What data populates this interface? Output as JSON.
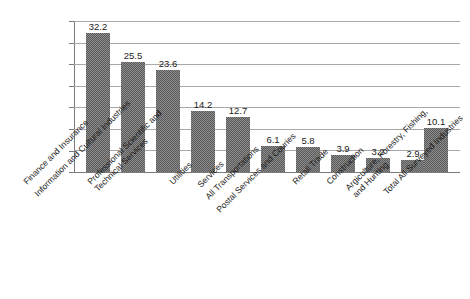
{
  "chart_data": {
    "type": "bar",
    "title": "",
    "subtitle": "",
    "xlabel": "",
    "ylabel": "",
    "ylim": [
      0,
      35
    ],
    "ytick_step": 5,
    "yticks": [
      "0",
      "5",
      "10",
      "15",
      "20",
      "25",
      "30",
      "35"
    ],
    "grid": true,
    "legend": "none",
    "orientation": "vertical",
    "label_rotation_deg": -45,
    "bar_color": "#5a5a5a",
    "gridline_color": "#a8a8a8",
    "axis_color": "#7a7a7a",
    "background_color": "#ffffff",
    "categories": [
      "Finance and Insurance",
      "Information and Cultural Industries",
      "Professional Scientific and Technical Services",
      "Utilities",
      "Services",
      "All Transportations",
      "Postal Services and Couries",
      "Retail Trade",
      "Construction",
      "Argiculture, Forestry, Fishing, and Hunting",
      "Total All Surveyed Industries"
    ],
    "category_lines": [
      [
        "Finance and Insurance"
      ],
      [
        "Information and Cultural Industries"
      ],
      [
        "Professional Scientific and",
        "Technical Services"
      ],
      [
        "Utilities"
      ],
      [
        "Services"
      ],
      [
        "All Transportations"
      ],
      [
        "Postal Services and Couries"
      ],
      [
        "Retail Trade"
      ],
      [
        "Construction"
      ],
      [
        "Argiculture, Forestry, Fishing,",
        "and Hunting"
      ],
      [
        "Total All Surveyed Industries"
      ]
    ],
    "values": [
      32.2,
      25.5,
      23.6,
      14.2,
      12.7,
      6.1,
      5.8,
      3.9,
      3.2,
      2.9,
      10.1
    ],
    "value_labels": [
      "32.2",
      "25.5",
      "23.6",
      "14.2",
      "12.7",
      "6.1",
      "5.8",
      "3.9",
      "3.2",
      "2.9",
      "10.1"
    ]
  }
}
